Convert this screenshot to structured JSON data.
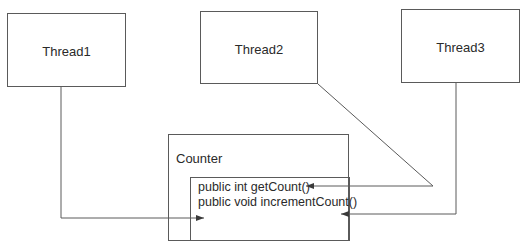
{
  "threads": [
    {
      "label": "Thread1"
    },
    {
      "label": "Thread2"
    },
    {
      "label": "Thread3"
    }
  ],
  "counter": {
    "title": "Counter",
    "methods": [
      {
        "signature": "public int getCount()"
      },
      {
        "signature": "public void incrementCount()"
      }
    ]
  },
  "connections": [
    {
      "from": "Thread1",
      "to": "Counter",
      "style": "orthogonal-arrow"
    },
    {
      "from": "Thread2",
      "to": "getCount()",
      "style": "diagonal-then-horizontal-arrow"
    },
    {
      "from": "Thread3",
      "to": "incrementCount()",
      "style": "orthogonal-arrow"
    }
  ],
  "colors": {
    "line": "#5a5a5a",
    "text": "#2a2a2a",
    "background": "#ffffff"
  }
}
